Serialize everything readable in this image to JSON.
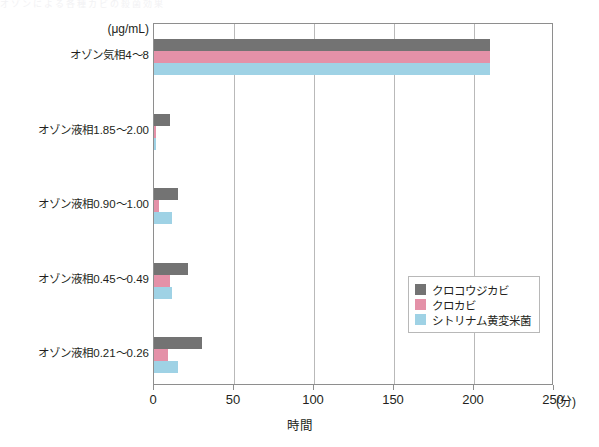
{
  "top_sliver_text": "オゾンによる各種カビの殺菌効果",
  "unit_label": "(μg/mL)",
  "axis": {
    "x_title": "時間",
    "x_unit": "(分)",
    "x_ticks": [
      "0",
      "50",
      "100",
      "150",
      "200",
      "250"
    ]
  },
  "legend": {
    "items": [
      {
        "label": "クロコウジカビ",
        "color": "#737373"
      },
      {
        "label": "クロカビ",
        "color": "#e491a8"
      },
      {
        "label": "シトリナム黄変米菌",
        "color": "#9fd2e5"
      }
    ]
  },
  "chart_data": {
    "type": "bar",
    "orientation": "horizontal",
    "title": "",
    "xlabel": "時間",
    "ylabel": "(μg/mL)",
    "xlim": [
      0,
      250
    ],
    "xticks": [
      0,
      50,
      100,
      150,
      200,
      250
    ],
    "x_unit": "分",
    "grid": "vertical",
    "legend_position": "inside-right-lower",
    "categories": [
      "オゾン気相4〜8",
      "オゾン液相1.85〜2.00",
      "オゾン液相0.90〜1.00",
      "オゾン液相0.45〜0.49",
      "オゾン液相0.21〜0.26"
    ],
    "series": [
      {
        "name": "クロコウジカビ",
        "color": "#737373",
        "values": [
          210,
          10,
          15,
          21,
          30
        ]
      },
      {
        "name": "クロカビ",
        "color": "#e491a8",
        "values": [
          210,
          1,
          3,
          10,
          9
        ]
      },
      {
        "name": "シトリナム黄変米菌",
        "color": "#9fd2e5",
        "values": [
          210,
          1,
          11,
          11,
          15
        ]
      }
    ]
  }
}
